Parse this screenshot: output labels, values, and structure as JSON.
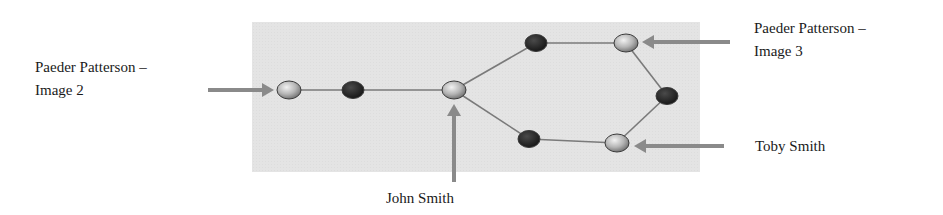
{
  "diagram": {
    "labels": {
      "paeder_image2": {
        "line1": "Paeder Patterson –",
        "line2": "Image 2"
      },
      "paeder_image3": {
        "line1": "Paeder Patterson –",
        "line2": "Image 3"
      },
      "john_smith": "John Smith",
      "toby_smith": "Toby Smith"
    },
    "colors": {
      "panel_background": "#e4e4e4",
      "edge": "#7a7a7a",
      "labeled_node": "#b8b8b8",
      "intermediate_node": "#2a2a2a",
      "arrow": "#8a8a8a"
    },
    "nodes": [
      {
        "id": "paeder-image2",
        "type": "labeled",
        "x": 289,
        "y": 90
      },
      {
        "id": "mid-1",
        "type": "intermediate",
        "x": 353,
        "y": 90
      },
      {
        "id": "john-smith",
        "type": "labeled",
        "x": 454,
        "y": 90
      },
      {
        "id": "upper-mid",
        "type": "intermediate",
        "x": 536,
        "y": 43
      },
      {
        "id": "paeder-image3",
        "type": "labeled",
        "x": 626,
        "y": 43
      },
      {
        "id": "right-mid",
        "type": "intermediate",
        "x": 667,
        "y": 96
      },
      {
        "id": "toby-smith",
        "type": "labeled",
        "x": 617,
        "y": 143
      },
      {
        "id": "lower-mid",
        "type": "intermediate",
        "x": 529,
        "y": 139
      }
    ],
    "edges": [
      [
        "paeder-image2",
        "mid-1"
      ],
      [
        "mid-1",
        "john-smith"
      ],
      [
        "john-smith",
        "upper-mid"
      ],
      [
        "upper-mid",
        "paeder-image3"
      ],
      [
        "paeder-image3",
        "right-mid"
      ],
      [
        "right-mid",
        "toby-smith"
      ],
      [
        "john-smith",
        "lower-mid"
      ],
      [
        "lower-mid",
        "toby-smith"
      ]
    ]
  }
}
